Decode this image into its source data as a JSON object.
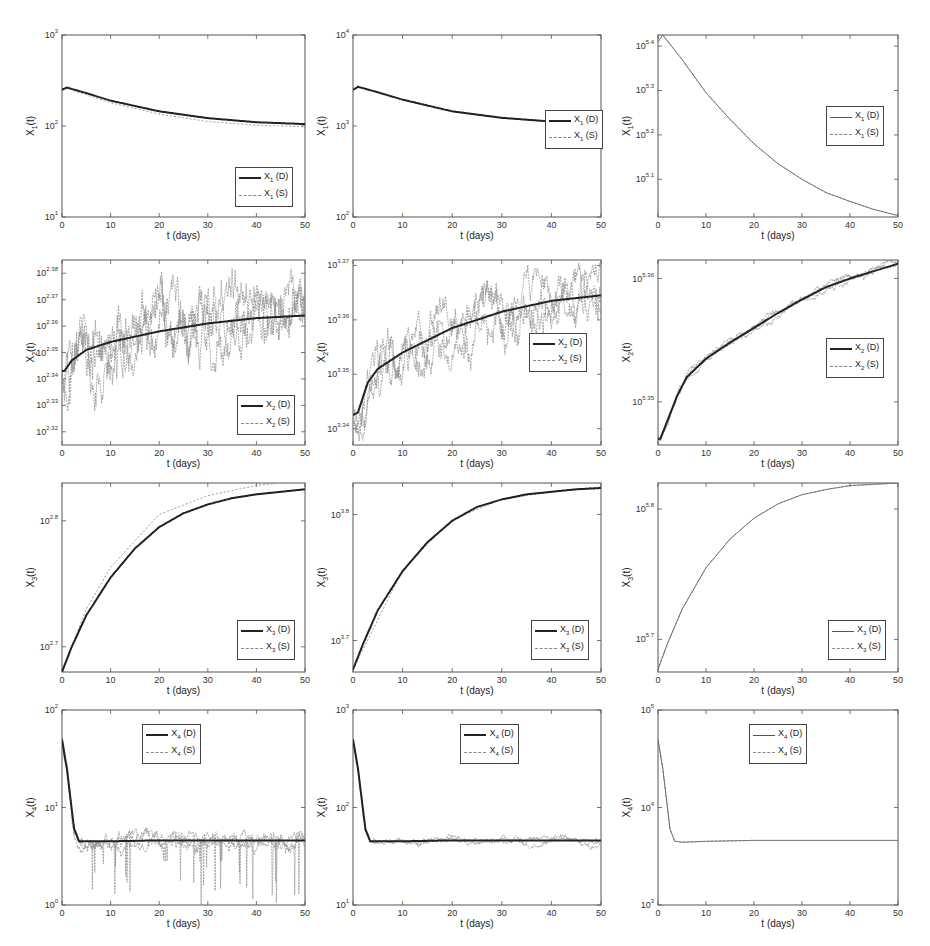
{
  "figure": {
    "rows": 4,
    "cols": 3,
    "xlabel": "t (days)",
    "xticks": [
      0,
      10,
      20,
      30,
      40,
      50
    ],
    "xlim": [
      0,
      50
    ]
  },
  "chart_data": [
    {
      "id": "r1c1",
      "type": "line",
      "yscale": "log",
      "ylabel": "X1(t)",
      "xlabel": "t (days)",
      "xlim": [
        0,
        50
      ],
      "ylim_exp": [
        1,
        3
      ],
      "ytick_exps": [
        1,
        2,
        3
      ],
      "ytick_labels": [
        "10^1",
        "10^2",
        "10^3"
      ],
      "legend": {
        "entries": [
          "X1 (D)",
          "X1 (S)"
        ],
        "position": "lower right"
      },
      "series": [
        {
          "name": "X1 (D)",
          "style": "solid thick",
          "x": [
            0,
            1,
            5,
            10,
            20,
            30,
            40,
            50
          ],
          "y": [
            250,
            265,
            230,
            190,
            145,
            122,
            110,
            105
          ]
        },
        {
          "name": "X1 (S)",
          "style": "dotted",
          "x": [
            0,
            1,
            5,
            10,
            20,
            30,
            40,
            50
          ],
          "y": [
            250,
            260,
            220,
            180,
            135,
            112,
            102,
            98
          ]
        }
      ]
    },
    {
      "id": "r1c2",
      "type": "line",
      "yscale": "log",
      "ylabel": "X1(t)",
      "xlabel": "t (days)",
      "xlim": [
        0,
        50
      ],
      "ylim_exp": [
        2,
        4
      ],
      "ytick_exps": [
        2,
        3,
        4
      ],
      "ytick_labels": [
        "10^2",
        "10^3",
        "10^4"
      ],
      "legend": {
        "entries": [
          "X1 (D)",
          "X1 (S)"
        ],
        "position": "center right"
      },
      "series": [
        {
          "name": "X1 (D)",
          "style": "solid thick",
          "x": [
            0,
            1,
            5,
            10,
            20,
            30,
            40,
            50
          ],
          "y": [
            2500,
            2700,
            2350,
            1950,
            1450,
            1230,
            1120,
            1080
          ]
        },
        {
          "name": "X1 (S)",
          "style": "dotted",
          "x": [
            0,
            1,
            5,
            10,
            20,
            30,
            40,
            50
          ],
          "y": [
            2500,
            2680,
            2330,
            1930,
            1440,
            1220,
            1110,
            1070
          ]
        }
      ]
    },
    {
      "id": "r1c3",
      "type": "line",
      "yscale": "log",
      "ylabel": "X1(t)",
      "xlabel": "t (days)",
      "xlim": [
        0,
        50
      ],
      "ylim_exp": [
        5.015,
        5.425
      ],
      "ytick_exps": [
        5.1,
        5.2,
        5.3,
        5.4
      ],
      "ytick_labels": [
        "10^5.1",
        "10^5.2",
        "10^5.3",
        "10^5.4"
      ],
      "legend": {
        "entries": [
          "X1 (D)",
          "X1 (S)"
        ],
        "position": "center right"
      },
      "series": [
        {
          "name": "X1 (D)",
          "style": "solid thin",
          "x": [
            0,
            1,
            5,
            10,
            15,
            20,
            25,
            30,
            35,
            40,
            45,
            50
          ],
          "y_exp": [
            5.41,
            5.425,
            5.37,
            5.295,
            5.235,
            5.18,
            5.135,
            5.1,
            5.07,
            5.05,
            5.032,
            5.018
          ]
        },
        {
          "name": "X1 (S)",
          "style": "dashed",
          "x": [
            0,
            1,
            5,
            10,
            15,
            20,
            25,
            30,
            35,
            40,
            45,
            50
          ],
          "y_exp": [
            5.41,
            5.425,
            5.37,
            5.295,
            5.235,
            5.18,
            5.135,
            5.1,
            5.07,
            5.05,
            5.032,
            5.018
          ]
        }
      ]
    },
    {
      "id": "r2c1",
      "type": "line",
      "yscale": "log",
      "ylabel": "X2(t)",
      "xlabel": "t (days)",
      "xlim": [
        0,
        50
      ],
      "ylim_exp": [
        2.315,
        2.385
      ],
      "ytick_exps": [
        2.32,
        2.33,
        2.34,
        2.35,
        2.36,
        2.37,
        2.38
      ],
      "ytick_labels": [
        "10^2.32",
        "10^2.33",
        "10^2.34",
        "10^2.35",
        "10^2.36",
        "10^2.37",
        "10^2.38"
      ],
      "legend": {
        "entries": [
          "X2 (D)",
          "X2 (S)"
        ],
        "position": "lower right"
      },
      "series": [
        {
          "name": "X2 (D)",
          "style": "solid thick",
          "x": [
            0,
            0.5,
            2,
            5,
            10,
            20,
            30,
            40,
            50
          ],
          "y_exp": [
            2.343,
            2.343,
            2.347,
            2.351,
            2.354,
            2.358,
            2.361,
            2.363,
            2.364
          ]
        },
        {
          "name": "X2 (S)",
          "style": "dotted noisy",
          "x": [
            0,
            3,
            4,
            10,
            20,
            30,
            40,
            50
          ],
          "y_exp": [
            2.34,
            2.378,
            2.318,
            2.325,
            2.37,
            2.379,
            2.33,
            2.385
          ]
        }
      ]
    },
    {
      "id": "r2c2",
      "type": "line",
      "yscale": "log",
      "ylabel": "X2(t)",
      "xlabel": "t (days)",
      "xlim": [
        0,
        50
      ],
      "ylim_exp": [
        3.337,
        3.371
      ],
      "ytick_exps": [
        3.34,
        3.35,
        3.36,
        3.37
      ],
      "ytick_labels": [
        "10^3.34",
        "10^3.35",
        "10^3.36",
        "10^3.37"
      ],
      "legend": {
        "entries": [
          "X2 (D)",
          "X2 (S)"
        ],
        "position": "center right"
      },
      "series": [
        {
          "name": "X2 (D)",
          "style": "solid thick",
          "x": [
            0,
            1,
            3,
            5,
            10,
            20,
            30,
            40,
            50
          ],
          "y_exp": [
            3.3425,
            3.343,
            3.3485,
            3.351,
            3.354,
            3.3585,
            3.3615,
            3.3635,
            3.3645
          ]
        },
        {
          "name": "X2 (S)",
          "style": "dotted noisy",
          "x": [
            0,
            5,
            10,
            20,
            30,
            40,
            50
          ],
          "y_exp": [
            3.339,
            3.351,
            3.355,
            3.361,
            3.363,
            3.37,
            3.366
          ]
        }
      ]
    },
    {
      "id": "r2c3",
      "type": "line",
      "yscale": "log",
      "ylabel": "X2(t)",
      "xlabel": "t (days)",
      "xlim": [
        0,
        50
      ],
      "ylim_exp": [
        5.3465,
        5.3615
      ],
      "ytick_exps": [
        5.35,
        5.36
      ],
      "ytick_labels": [
        "10^5.35",
        "10^5.36"
      ],
      "legend": {
        "entries": [
          "X2 (D)",
          "X2 (S)"
        ],
        "position": "center right"
      },
      "series": [
        {
          "name": "X2 (D)",
          "style": "solid thick",
          "x": [
            0,
            0.5,
            2,
            4,
            6,
            10,
            15,
            20,
            25,
            30,
            35,
            40,
            45,
            50
          ],
          "y_exp": [
            5.347,
            5.347,
            5.3485,
            5.3505,
            5.352,
            5.3535,
            5.3548,
            5.356,
            5.3572,
            5.3583,
            5.3593,
            5.36,
            5.3606,
            5.3612
          ]
        },
        {
          "name": "X2 (S)",
          "style": "thin noisy",
          "x": [
            0,
            10,
            20,
            30,
            40,
            50
          ],
          "y_exp": [
            5.347,
            5.3537,
            5.3562,
            5.3585,
            5.3601,
            5.3614
          ]
        }
      ]
    },
    {
      "id": "r3c1",
      "type": "line",
      "yscale": "log",
      "ylabel": "X3(t)",
      "xlabel": "t (days)",
      "xlim": [
        0,
        50
      ],
      "ylim_exp": [
        2.68,
        2.83
      ],
      "ytick_exps": [
        2.7,
        2.8
      ],
      "ytick_labels": [
        "10^2.7",
        "10^2.8"
      ],
      "legend": {
        "entries": [
          "X3 (D)",
          "X3 (S)"
        ],
        "position": "lower right"
      },
      "series": [
        {
          "name": "X3 (D)",
          "style": "solid thick",
          "x": [
            0,
            2,
            5,
            10,
            15,
            20,
            25,
            30,
            35,
            40,
            45,
            50
          ],
          "y_exp": [
            2.68,
            2.7,
            2.725,
            2.755,
            2.778,
            2.795,
            2.806,
            2.813,
            2.818,
            2.821,
            2.823,
            2.825
          ]
        },
        {
          "name": "X3 (S)",
          "style": "dotted",
          "x": [
            0,
            5,
            10,
            20,
            30,
            40,
            50
          ],
          "y_exp": [
            2.68,
            2.73,
            2.763,
            2.805,
            2.82,
            2.828,
            2.832
          ]
        }
      ]
    },
    {
      "id": "r3c2",
      "type": "line",
      "yscale": "log",
      "ylabel": "X3(t)",
      "xlabel": "t (days)",
      "xlim": [
        0,
        50
      ],
      "ylim_exp": [
        3.675,
        3.825
      ],
      "ytick_exps": [
        3.7,
        3.8
      ],
      "ytick_labels": [
        "10^3.7",
        "10^3.8"
      ],
      "legend": {
        "entries": [
          "X3 (D)",
          "X3 (S)"
        ],
        "position": "lower right"
      },
      "series": [
        {
          "name": "X3 (D)",
          "style": "solid thick",
          "x": [
            0,
            2,
            5,
            10,
            15,
            20,
            25,
            30,
            35,
            40,
            45,
            50
          ],
          "y_exp": [
            3.677,
            3.697,
            3.724,
            3.755,
            3.778,
            3.795,
            3.806,
            3.812,
            3.816,
            3.818,
            3.82,
            3.821
          ]
        },
        {
          "name": "X3 (S)",
          "style": "dotted",
          "x": [
            0,
            10,
            20,
            30,
            40,
            50
          ],
          "y_exp": [
            3.677,
            3.756,
            3.796,
            3.812,
            3.818,
            3.822
          ]
        }
      ]
    },
    {
      "id": "r3c3",
      "type": "line",
      "yscale": "log",
      "ylabel": "X3(t)",
      "xlabel": "t (days)",
      "xlim": [
        0,
        50
      ],
      "ylim_exp": [
        5.675,
        5.82
      ],
      "ytick_exps": [
        5.7,
        5.8
      ],
      "ytick_labels": [
        "10^5.7",
        "10^5.8"
      ],
      "legend": {
        "entries": [
          "X3 (D)",
          "X3 (S)"
        ],
        "position": "lower right"
      },
      "series": [
        {
          "name": "X3 (D)",
          "style": "solid thin",
          "x": [
            0,
            2,
            5,
            10,
            15,
            20,
            25,
            30,
            35,
            40,
            45,
            50
          ],
          "y_exp": [
            5.677,
            5.697,
            5.723,
            5.755,
            5.777,
            5.793,
            5.804,
            5.811,
            5.815,
            5.818,
            5.819,
            5.82
          ]
        },
        {
          "name": "X3 (S)",
          "style": "dashed",
          "x": [
            0,
            2,
            5,
            10,
            15,
            20,
            25,
            30,
            35,
            40,
            45,
            50
          ],
          "y_exp": [
            5.677,
            5.697,
            5.723,
            5.755,
            5.777,
            5.793,
            5.804,
            5.811,
            5.815,
            5.818,
            5.819,
            5.82
          ]
        }
      ]
    },
    {
      "id": "r4c1",
      "type": "line",
      "yscale": "log",
      "ylabel": "X4(t)",
      "xlabel": "t (days)",
      "xlim": [
        0,
        50
      ],
      "ylim_exp": [
        0,
        2
      ],
      "ytick_exps": [
        0,
        1,
        2
      ],
      "ytick_labels": [
        "10^0",
        "10^1",
        "10^2"
      ],
      "legend": {
        "entries": [
          "X4 (D)",
          "X4 (S)"
        ],
        "position": "upper center"
      },
      "series": [
        {
          "name": "X4 (D)",
          "style": "solid thick",
          "x": [
            0,
            1,
            2.5,
            3.5,
            10,
            20,
            30,
            40,
            50
          ],
          "y": [
            50,
            25,
            6,
            4.5,
            4.5,
            4.6,
            4.6,
            4.6,
            4.6
          ]
        },
        {
          "name": "X4 (S)",
          "style": "dotted noisy",
          "x": [
            0,
            3,
            10,
            17,
            18,
            27,
            37,
            50
          ],
          "y": [
            50,
            5,
            5,
            1,
            1,
            1.5,
            1,
            5
          ]
        }
      ]
    },
    {
      "id": "r4c2",
      "type": "line",
      "yscale": "log",
      "ylabel": "X4(t)",
      "xlabel": "t (days)",
      "xlim": [
        0,
        50
      ],
      "ylim_exp": [
        1,
        3
      ],
      "ytick_exps": [
        1,
        2,
        3
      ],
      "ytick_labels": [
        "10^1",
        "10^2",
        "10^3"
      ],
      "legend": {
        "entries": [
          "X4 (D)",
          "X4 (S)"
        ],
        "position": "upper center"
      },
      "series": [
        {
          "name": "X4 (D)",
          "style": "solid thick",
          "x": [
            0,
            1,
            2.5,
            3.5,
            10,
            20,
            30,
            40,
            50
          ],
          "y": [
            500,
            250,
            60,
            45,
            45,
            46,
            46,
            46,
            46
          ]
        },
        {
          "name": "X4 (S)",
          "style": "dotted noisy",
          "x": [
            0,
            3,
            10,
            20,
            30,
            40,
            50
          ],
          "y": [
            500,
            45,
            44,
            46,
            45,
            46,
            46
          ]
        }
      ]
    },
    {
      "id": "r4c3",
      "type": "line",
      "yscale": "log",
      "ylabel": "X4(t)",
      "xlabel": "t (days)",
      "xlim": [
        0,
        50
      ],
      "ylim_exp": [
        3,
        5
      ],
      "ytick_exps": [
        3,
        4,
        5
      ],
      "ytick_labels": [
        "10^3",
        "10^4",
        "10^5"
      ],
      "legend": {
        "entries": [
          "X4 (D)",
          "X4 (S)"
        ],
        "position": "upper center"
      },
      "series": [
        {
          "name": "X4 (D)",
          "style": "solid thin",
          "x": [
            0,
            1,
            2.5,
            3.5,
            5,
            10,
            20,
            30,
            40,
            50
          ],
          "y": [
            50000,
            25000,
            6000,
            4500,
            4400,
            4500,
            4600,
            4600,
            4600,
            4600
          ]
        },
        {
          "name": "X4 (S)",
          "style": "dashed",
          "x": [
            0,
            1,
            2.5,
            3.5,
            5,
            10,
            20,
            30,
            40,
            50
          ],
          "y": [
            50000,
            25000,
            6000,
            4500,
            4400,
            4500,
            4600,
            4600,
            4600,
            4600
          ]
        }
      ]
    }
  ]
}
